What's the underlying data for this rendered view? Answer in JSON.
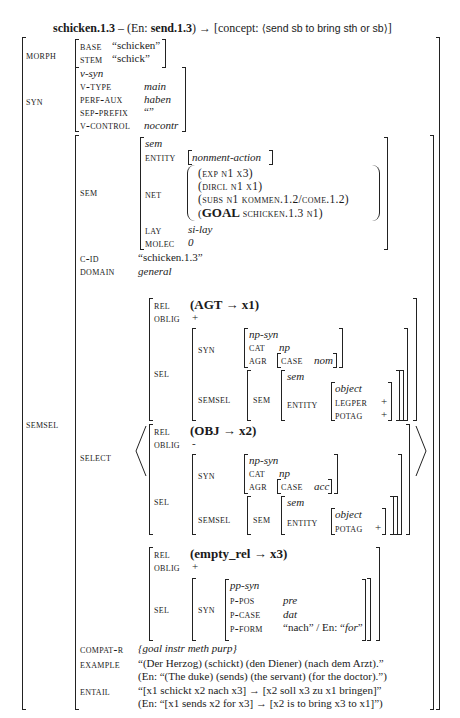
{
  "title": {
    "lemma": "schicken.1.3",
    "dash": " – (En: ",
    "en_lemma": "send.1.3",
    "close": ") → [concept: ",
    "concept": "⟨send sb to bring sth or sb⟩",
    "end": "]"
  },
  "morph": {
    "label": "MORPH",
    "base_label": "BASE",
    "base_value": "“schicken”",
    "stem_label": "STEM",
    "stem_value": "“schick”"
  },
  "syn": {
    "label": "SYN",
    "type": "v-syn",
    "vtype_label": "V-TYPE",
    "vtype_value": "main",
    "perfaux_label": "PERF-AUX",
    "perfaux_value": "haben",
    "sepprefix_label": "SEP-PREFIX",
    "sepprefix_value": "“”",
    "vcontrol_label": "V-CONTROL",
    "vcontrol_value": "nocontr"
  },
  "semsel": {
    "label": "SEMSEL",
    "sem": {
      "label": "SEM",
      "type": "sem",
      "entity_label": "ENTITY",
      "entity_value": "nonment-action",
      "net_label": "NET",
      "net": [
        "(EXP N1 X3)",
        "(DIRCL N1 X1)",
        "(SUBS N1 KOMMEN.1.2/COME.1.2)",
        "SCHICKEN.1.3 N1)"
      ],
      "net_goal": "GOAL",
      "net_goal_open": "(",
      "lay_label": "LAY",
      "lay_value": "si-lay",
      "molec_label": "MOLEC",
      "molec_value": "0"
    },
    "cid_label": "C-ID",
    "cid_value": "“schicken.1.3”",
    "domain_label": "DOMAIN",
    "domain_value": "general",
    "select_label": "SELECT",
    "select": [
      {
        "rel_label": "REL",
        "rel_value": "(AGT → x1)",
        "oblig_label": "OBLIG",
        "oblig_value": "+",
        "sel_label": "SEL",
        "syn_label": "SYN",
        "syn_type": "np-syn",
        "cat_label": "CAT",
        "cat_value": "np",
        "agr_label": "AGR",
        "case_label": "CASE",
        "case_value": "nom",
        "semsel_label": "SEMSEL",
        "sem_label": "SEM",
        "sem_type": "sem",
        "entity_label": "ENTITY",
        "entity_type": "object",
        "legper_label": "LEGPER",
        "legper_value": "+",
        "potag_label": "POTAG",
        "potag_value": "+"
      },
      {
        "rel_label": "REL",
        "rel_value": "(OBJ → x2)",
        "oblig_label": "OBLIG",
        "oblig_value": "-",
        "sel_label": "SEL",
        "syn_label": "SYN",
        "syn_type": "np-syn",
        "cat_label": "CAT",
        "cat_value": "np",
        "agr_label": "AGR",
        "case_label": "CASE",
        "case_value": "acc",
        "semsel_label": "SEMSEL",
        "sem_label": "SEM",
        "sem_type": "sem",
        "entity_label": "ENTITY",
        "entity_type": "object",
        "potag_label": "POTAG",
        "potag_value": "+"
      },
      {
        "rel_label": "REL",
        "rel_value": "(empty_rel → x3)",
        "oblig_label": "OBLIG",
        "oblig_value": "+",
        "sel_label": "SEL",
        "syn_label": "SYN",
        "syn_type": "pp-syn",
        "ppos_label": "P-POS",
        "ppos_value": "pre",
        "pcase_label": "P-CASE",
        "pcase_value": "dat",
        "pform_label": "P-FORM",
        "pform_value_a": "“nach” / En: “",
        "pform_value_b": "for",
        "pform_value_c": "”"
      }
    ],
    "compat_label": "COMPAT-R",
    "compat_value": "{goal instr meth purp}",
    "example_label": "EXAMPLE",
    "example_de": "“(Der Herzog) (schickt) (den Diener) (nach dem Arzt).”",
    "example_en": "(En: “(The duke) (sends) (the servant) (for the doctor).”)",
    "entail_label": "ENTAIL",
    "entail_de": "“[x1 schickt x2 nach x3] → [x2 soll x3 zu x1 bringen]”",
    "entail_en": "(En: “[x1 sends x2 for x3] → [x2 is to bring x3 to x1]”)"
  }
}
